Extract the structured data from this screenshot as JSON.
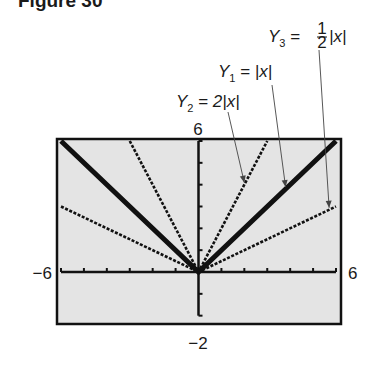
{
  "figure": {
    "title": "Figure 30"
  },
  "chart_data": {
    "type": "line",
    "title": "Figure 30",
    "xlabel": "",
    "ylabel": "",
    "xlim": [
      -6,
      6
    ],
    "ylim": [
      -2,
      6
    ],
    "window_labels": {
      "xmin": "−6",
      "xmax": "6",
      "ymin": "−2",
      "ymax": "6"
    },
    "grid": false,
    "axes_ticks": {
      "x_step": 1,
      "y_step": 1
    },
    "series": [
      {
        "name": "Y1 = |x|",
        "expr": "abs(x)",
        "style": "thick",
        "x": [
          -6,
          0,
          6
        ],
        "y": [
          6,
          0,
          6
        ]
      },
      {
        "name": "Y2 = 2|x|",
        "expr": "2*abs(x)",
        "style": "dotted",
        "x": [
          -3,
          0,
          3
        ],
        "y": [
          6,
          0,
          6
        ]
      },
      {
        "name": "Y3 = 1/2|x|",
        "expr": "0.5*abs(x)",
        "style": "dotted",
        "x": [
          -6,
          0,
          6
        ],
        "y": [
          3,
          0,
          3
        ]
      }
    ],
    "annotations": [
      {
        "text": "Y3 = ½|x|",
        "points_to": [
          5.7,
          2.85
        ]
      },
      {
        "text": "Y1 = |x|",
        "points_to": [
          3.8,
          3.8
        ]
      },
      {
        "text": "Y2 = 2|x|",
        "points_to": [
          2.0,
          4.0
        ]
      }
    ]
  },
  "labels": {
    "y3": {
      "lhs": "Y",
      "sub": "3",
      "eq": " = ",
      "num": "1",
      "den": "2",
      "rhs": "|x|"
    },
    "y1": {
      "lhs": "Y",
      "sub": "1",
      "eq": " = ",
      "rhs": "|x|"
    },
    "y2": {
      "lhs": "Y",
      "sub": "2",
      "eq": " = ",
      "rhs": "2|x|"
    }
  }
}
